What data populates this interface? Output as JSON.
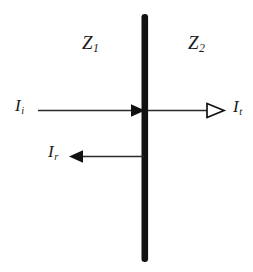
{
  "figure": {
    "background_color": "#ffffff",
    "ink_color": "#1a1a1a",
    "barrier_color": "#111111"
  },
  "media": {
    "left": {
      "symbol": "Z",
      "subscript": "1"
    },
    "right": {
      "symbol": "Z",
      "subscript": "2"
    }
  },
  "waves": {
    "incident": {
      "symbol": "I",
      "subscript": "i",
      "direction": "right",
      "arrowhead": "solid"
    },
    "transmitted": {
      "symbol": "I",
      "subscript": "t",
      "direction": "right",
      "arrowhead": "hollow"
    },
    "reflected": {
      "symbol": "I",
      "subscript": "r",
      "direction": "left",
      "arrowhead": "solid"
    }
  },
  "barrier": {
    "name": "interface-boundary",
    "orientation": "vertical"
  }
}
